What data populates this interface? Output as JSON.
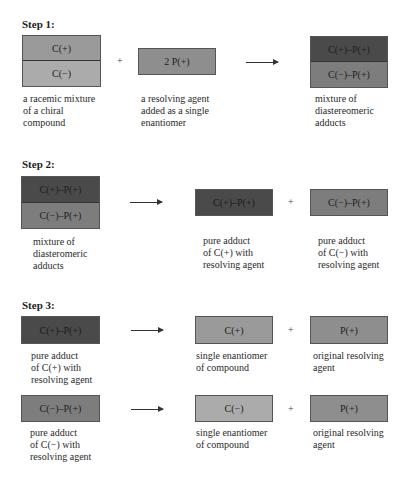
{
  "steps": [
    {
      "title": "Step 1:",
      "racemic": {
        "top": "C(+)",
        "bottom": "C(−)",
        "caption": "a racemic mixture\nof a chiral\ncompound"
      },
      "plus": "+",
      "agent": {
        "label": "2 P(+)",
        "caption": "a resolving agent\nadded as a single\nenantiomer"
      },
      "product": {
        "top": "C(+)–P(+)",
        "bottom": "C(−)–P(+)",
        "caption": "mixture of\ndiastereomeric\nadducts"
      }
    },
    {
      "title": "Step 2:",
      "mixture": {
        "top": "C(+)–P(+)",
        "bottom": "C(−)–P(+)",
        "caption": "mixture of\ndiasteromeric\nadducts"
      },
      "product1": {
        "label": "C(+)–P(+)",
        "caption": "pure adduct\nof C(+) with\nresolving agent"
      },
      "plus": "+",
      "product2": {
        "label": "C(−)–P(+)",
        "caption": "pure adduct\nof C(−) with\nresolving agent"
      }
    },
    {
      "title": "Step 3:",
      "rows": [
        {
          "reactant": {
            "label": "C(+)–P(+)",
            "caption": "pure adduct\nof C(+) with\nresolving agent"
          },
          "product1": {
            "label": "C(+)",
            "caption": "single enantiomer\nof compound"
          },
          "plus": "+",
          "product2": {
            "label": "P(+)",
            "caption": "original resolving\nagent"
          }
        },
        {
          "reactant": {
            "label": "C(−)–P(+)",
            "caption": "pure adduct\nof C(−) with\nresolving agent"
          },
          "product1": {
            "label": "C(−)",
            "caption": "single enantiomer\nof compound"
          },
          "plus": "+",
          "product2": {
            "label": "P(+)",
            "caption": "original resolving\nagent"
          }
        }
      ]
    }
  ],
  "colors": {
    "c_plus": "#9a9a9a",
    "c_minus": "#ababab",
    "p_plus": "#8e8e8e",
    "cplus_pplus_adduct": "#4a4a4a",
    "cminus_pplus_adduct": "#7d7d7d"
  }
}
